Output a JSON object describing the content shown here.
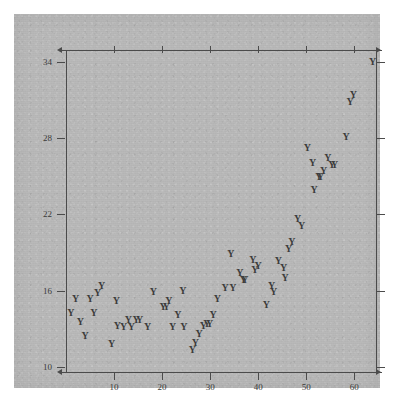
{
  "figure": {
    "cropped_header_text": "",
    "marker_glyph": "Y",
    "marker_color": "#3c3c3c",
    "axis_color": "#4b4b4b",
    "panel_color": "#b8b8b8",
    "page_color": "#ffffff"
  },
  "chart_data": {
    "type": "scatter",
    "title": "",
    "xlabel": "",
    "ylabel": "",
    "xlim": [
      0,
      64.5
    ],
    "ylim": [
      9.6,
      34.6
    ],
    "xticks": [
      10,
      20,
      30,
      40,
      50,
      60
    ],
    "yticks": [
      10,
      16,
      22,
      28,
      34
    ],
    "xtick_labels": [
      "10",
      "20",
      "30",
      "40",
      "50",
      "60"
    ],
    "ytick_labels": [
      "10",
      "16",
      "22",
      "28",
      "34"
    ],
    "grid": false,
    "legend": null,
    "marker": "Y",
    "ticks_all_sides": true,
    "points": [
      {
        "x": 1.0,
        "y": 14.2
      },
      {
        "x": 2.0,
        "y": 15.3
      },
      {
        "x": 3.0,
        "y": 13.5
      },
      {
        "x": 4.0,
        "y": 12.4
      },
      {
        "x": 5.0,
        "y": 15.3
      },
      {
        "x": 5.8,
        "y": 14.2
      },
      {
        "x": 6.6,
        "y": 15.8
      },
      {
        "x": 7.4,
        "y": 16.4
      },
      {
        "x": 9.5,
        "y": 11.8
      },
      {
        "x": 10.5,
        "y": 15.2
      },
      {
        "x": 10.7,
        "y": 13.2
      },
      {
        "x": 12.0,
        "y": 13.1
      },
      {
        "x": 13.0,
        "y": 13.7
      },
      {
        "x": 13.6,
        "y": 13.1
      },
      {
        "x": 14.6,
        "y": 13.7
      },
      {
        "x": 15.3,
        "y": 13.7
      },
      {
        "x": 17.0,
        "y": 13.1
      },
      {
        "x": 18.2,
        "y": 15.9
      },
      {
        "x": 20.2,
        "y": 14.7
      },
      {
        "x": 20.9,
        "y": 14.7
      },
      {
        "x": 21.4,
        "y": 15.2
      },
      {
        "x": 22.2,
        "y": 13.1
      },
      {
        "x": 23.3,
        "y": 14.1
      },
      {
        "x": 24.3,
        "y": 16.0
      },
      {
        "x": 24.5,
        "y": 13.1
      },
      {
        "x": 26.3,
        "y": 11.3
      },
      {
        "x": 26.9,
        "y": 11.9
      },
      {
        "x": 27.7,
        "y": 12.6
      },
      {
        "x": 28.6,
        "y": 13.2
      },
      {
        "x": 29.3,
        "y": 13.4
      },
      {
        "x": 29.9,
        "y": 13.4
      },
      {
        "x": 30.6,
        "y": 14.1
      },
      {
        "x": 31.5,
        "y": 15.3
      },
      {
        "x": 33.1,
        "y": 16.2
      },
      {
        "x": 34.3,
        "y": 18.9
      },
      {
        "x": 34.7,
        "y": 16.2
      },
      {
        "x": 36.2,
        "y": 17.4
      },
      {
        "x": 36.9,
        "y": 16.8
      },
      {
        "x": 37.2,
        "y": 16.8
      },
      {
        "x": 38.9,
        "y": 18.4
      },
      {
        "x": 39.3,
        "y": 17.6
      },
      {
        "x": 40.0,
        "y": 17.9
      },
      {
        "x": 41.7,
        "y": 14.9
      },
      {
        "x": 42.8,
        "y": 16.4
      },
      {
        "x": 43.2,
        "y": 15.9
      },
      {
        "x": 44.2,
        "y": 18.3
      },
      {
        "x": 45.3,
        "y": 17.8
      },
      {
        "x": 45.6,
        "y": 17.0
      },
      {
        "x": 46.3,
        "y": 19.3
      },
      {
        "x": 47.0,
        "y": 19.8
      },
      {
        "x": 48.2,
        "y": 21.6
      },
      {
        "x": 49.0,
        "y": 21.1
      },
      {
        "x": 50.2,
        "y": 27.2
      },
      {
        "x": 51.3,
        "y": 26.0
      },
      {
        "x": 51.6,
        "y": 23.9
      },
      {
        "x": 52.6,
        "y": 24.9
      },
      {
        "x": 53.0,
        "y": 24.9
      },
      {
        "x": 53.6,
        "y": 25.4
      },
      {
        "x": 54.5,
        "y": 26.4
      },
      {
        "x": 55.3,
        "y": 25.9
      },
      {
        "x": 55.9,
        "y": 25.9
      },
      {
        "x": 58.3,
        "y": 28.1
      },
      {
        "x": 59.1,
        "y": 30.8
      },
      {
        "x": 59.8,
        "y": 31.4
      },
      {
        "x": 63.8,
        "y": 34.0
      }
    ]
  }
}
